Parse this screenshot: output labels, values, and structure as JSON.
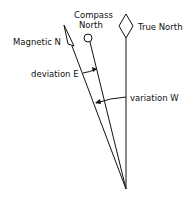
{
  "diagram": {
    "labels": {
      "compass_north_line1": "Compass",
      "compass_north_line2": "North",
      "true_north": "True North",
      "magnetic_north": "Magnetic N",
      "deviation": "deviation E",
      "variation": "variation W"
    },
    "colors": {
      "stroke": "#111111",
      "background": "#ffffff"
    }
  }
}
